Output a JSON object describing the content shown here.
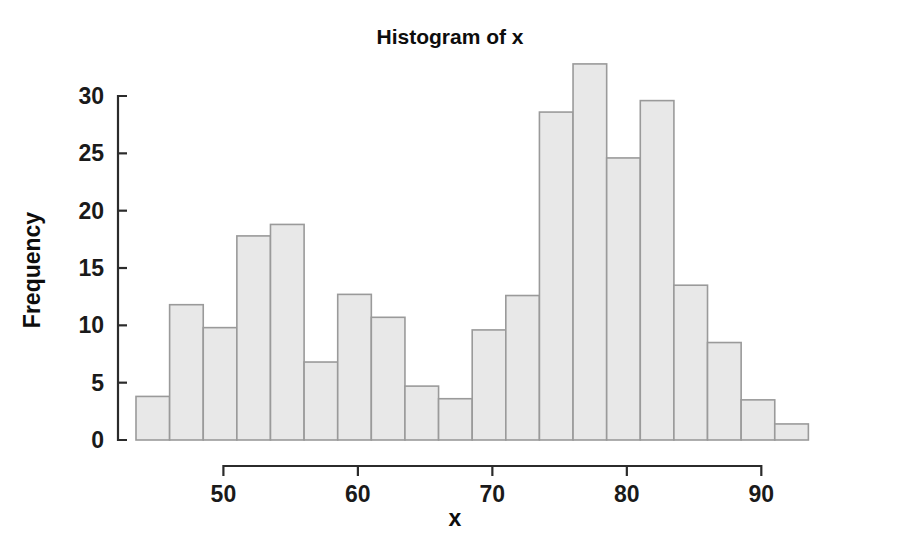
{
  "chart_data": {
    "type": "bar",
    "title": "Histogram of x",
    "xlabel": "x",
    "ylabel": "Frequency",
    "xlim": [
      43.5,
      96.0
    ],
    "ylim": [
      0,
      33.0
    ],
    "grid": false,
    "legend": "none",
    "bin_width": 2.5,
    "x_ticks": [
      50,
      60,
      70,
      80,
      90
    ],
    "y_ticks": [
      0,
      5,
      10,
      15,
      20,
      25,
      30
    ],
    "x_tick_labels": [
      "50",
      "60",
      "70",
      "80",
      "90"
    ],
    "y_tick_labels": [
      "0",
      "5",
      "10",
      "15",
      "20",
      "25",
      "30"
    ],
    "bin_edges": [
      43.5,
      46.0,
      48.5,
      51.0,
      53.5,
      56.0,
      58.5,
      61.0,
      63.5,
      66.0,
      68.5,
      71.0,
      73.5,
      76.0,
      78.5,
      81.0,
      83.5,
      86.0,
      88.5,
      91.0,
      93.5,
      96.0
    ],
    "categories": [
      "43.5-46",
      "46-48.5",
      "48.5-51",
      "51-53.5",
      "53.5-56",
      "56-58.5",
      "58.5-61",
      "61-63.5",
      "63.5-66",
      "66-68.5",
      "68.5-71",
      "71-73.5",
      "73.5-76",
      "76-78.5",
      "78.5-81",
      "81-83.5",
      "83.5-86",
      "86-88.5",
      "88.5-91",
      "91-93.5",
      "93.5-96"
    ],
    "values": [
      3.8,
      11.8,
      9.8,
      17.8,
      18.8,
      6.8,
      12.7,
      10.7,
      4.7,
      3.6,
      9.6,
      12.6,
      28.6,
      32.8,
      24.6,
      29.6,
      13.5,
      8.5,
      3.5,
      1.4,
      0
    ],
    "bars": [
      {
        "x0": 43.5,
        "x1": 46.0,
        "height": 3.8
      },
      {
        "x0": 46.0,
        "x1": 48.5,
        "height": 11.8
      },
      {
        "x0": 48.5,
        "x1": 51.0,
        "height": 9.8
      },
      {
        "x0": 51.0,
        "x1": 53.5,
        "height": 17.8
      },
      {
        "x0": 53.5,
        "x1": 56.0,
        "height": 18.8
      },
      {
        "x0": 56.0,
        "x1": 58.5,
        "height": 6.8
      },
      {
        "x0": 58.5,
        "x1": 61.0,
        "height": 12.7
      },
      {
        "x0": 61.0,
        "x1": 63.5,
        "height": 10.7
      },
      {
        "x0": 63.5,
        "x1": 66.0,
        "height": 4.7
      },
      {
        "x0": 66.0,
        "x1": 68.5,
        "height": 3.6
      },
      {
        "x0": 68.5,
        "x1": 71.0,
        "height": 9.6
      },
      {
        "x0": 71.0,
        "x1": 73.5,
        "height": 12.6
      },
      {
        "x0": 73.5,
        "x1": 76.0,
        "height": 28.6
      },
      {
        "x0": 76.0,
        "x1": 78.5,
        "height": 32.8
      },
      {
        "x0": 78.5,
        "x1": 81.0,
        "height": 24.6
      },
      {
        "x0": 81.0,
        "x1": 83.5,
        "height": 29.6
      },
      {
        "x0": 83.5,
        "x1": 86.0,
        "height": 13.5
      },
      {
        "x0": 86.0,
        "x1": 88.5,
        "height": 8.5
      },
      {
        "x0": 88.5,
        "x1": 91.0,
        "height": 3.5
      },
      {
        "x0": 91.0,
        "x1": 93.5,
        "height": 1.4
      }
    ],
    "colors": {
      "bar_fill": "#e8e8e8",
      "bar_stroke": "#9a9a9a",
      "axis": "#2b2b2b",
      "text": "#0d0d0d",
      "background": "#ffffff"
    }
  }
}
